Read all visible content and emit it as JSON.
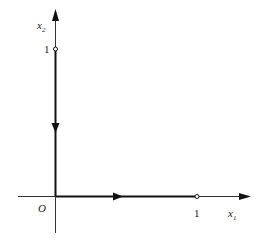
{
  "diagram": {
    "type": "phase-portrait",
    "axes": {
      "x": {
        "label": "x",
        "subscript": "1",
        "marked_value": "1"
      },
      "y": {
        "label": "x",
        "subscript": "2",
        "marked_value": "1"
      },
      "origin_label": "O"
    },
    "trajectories": [
      {
        "name": "x2-axis-segment",
        "direction": "toward-origin",
        "from": [
          0,
          1
        ],
        "to": [
          0,
          0
        ]
      },
      {
        "name": "x1-axis-segment",
        "direction": "away-from-origin",
        "from": [
          0,
          0
        ],
        "to": [
          1,
          0
        ]
      }
    ],
    "equilibria": [
      {
        "name": "point-0-1",
        "coords": [
          0,
          1
        ],
        "style": "open-circle"
      },
      {
        "name": "point-1-0",
        "coords": [
          1,
          0
        ],
        "style": "open-circle"
      }
    ],
    "colors": {
      "axis": "#1a1a1a",
      "background": "#ffffff"
    }
  }
}
